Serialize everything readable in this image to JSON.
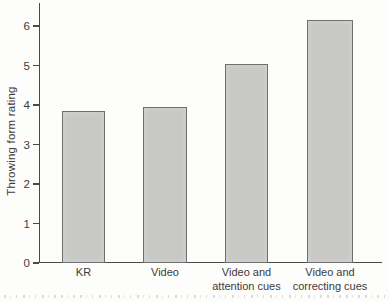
{
  "chart_data": {
    "type": "bar",
    "title": "",
    "xlabel": "",
    "ylabel": "Throwing form rating",
    "categories": [
      "KR",
      "Video",
      "Video and\nattention cues",
      "Video and\ncorrecting cues"
    ],
    "values": [
      3.85,
      3.95,
      5.05,
      6.15
    ],
    "yticks": [
      0,
      1,
      2,
      3,
      4,
      5,
      6
    ],
    "ylim": [
      0,
      6.5
    ],
    "grid": false,
    "legend": "none",
    "bar_fill_color": "#c8c8c6",
    "bar_border_color": "#6f6f6f",
    "axis_color": "#4a4a4a",
    "text_color": "#3b3b3b",
    "background_color": "#fdfdfc"
  }
}
